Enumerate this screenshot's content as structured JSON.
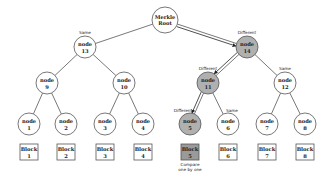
{
  "colors": {
    "same": "#ffffff",
    "different": "#b0b0b0",
    "block_different": "#9a9a9a",
    "stroke": "#555555"
  },
  "root": {
    "line1": "Merkle",
    "line2": "Root",
    "x": 165,
    "y": 20
  },
  "nodes": [
    {
      "id": "13",
      "label": "node",
      "num": "13",
      "x": 85,
      "y": 47,
      "status": "Same",
      "diff": false
    },
    {
      "id": "14",
      "label": "node",
      "num": "14",
      "x": 247,
      "y": 47,
      "status": "Different",
      "diff": true
    },
    {
      "id": "9",
      "label": "node",
      "num": "9",
      "x": 47,
      "y": 83,
      "status": "",
      "diff": false
    },
    {
      "id": "10",
      "label": "node",
      "num": "10",
      "x": 124,
      "y": 83,
      "status": "",
      "diff": false
    },
    {
      "id": "11",
      "label": "node",
      "num": "11",
      "x": 208,
      "y": 83,
      "status": "Different",
      "diff": true
    },
    {
      "id": "12",
      "label": "node",
      "num": "12",
      "x": 285,
      "y": 83,
      "status": "Same",
      "diff": false
    },
    {
      "id": "1",
      "label": "node",
      "num": "1",
      "x": 29,
      "y": 124,
      "status": "",
      "diff": false
    },
    {
      "id": "2",
      "label": "node",
      "num": "2",
      "x": 66,
      "y": 124,
      "status": "",
      "diff": false
    },
    {
      "id": "3",
      "label": "node",
      "num": "3",
      "x": 105,
      "y": 124,
      "status": "",
      "diff": false
    },
    {
      "id": "4",
      "label": "node",
      "num": "4",
      "x": 143,
      "y": 124,
      "status": "",
      "diff": false
    },
    {
      "id": "5",
      "label": "node",
      "num": "5",
      "x": 190,
      "y": 124,
      "status": "Different",
      "diff": true
    },
    {
      "id": "6",
      "label": "node",
      "num": "6",
      "x": 228,
      "y": 124,
      "status": "Same",
      "diff": false
    },
    {
      "id": "7",
      "label": "node",
      "num": "7",
      "x": 267,
      "y": 124,
      "status": "",
      "diff": false
    },
    {
      "id": "8",
      "label": "node",
      "num": "8",
      "x": 305,
      "y": 124,
      "status": "",
      "diff": false
    }
  ],
  "edges": [
    [
      "root",
      "13"
    ],
    [
      "root",
      "14"
    ],
    [
      "13",
      "9"
    ],
    [
      "13",
      "10"
    ],
    [
      "14",
      "11"
    ],
    [
      "14",
      "12"
    ],
    [
      "9",
      "1"
    ],
    [
      "9",
      "2"
    ],
    [
      "10",
      "3"
    ],
    [
      "10",
      "4"
    ],
    [
      "11",
      "5"
    ],
    [
      "11",
      "6"
    ],
    [
      "12",
      "7"
    ],
    [
      "12",
      "8"
    ]
  ],
  "diff_path": [
    [
      "root",
      "14"
    ],
    [
      "14",
      "11"
    ],
    [
      "11",
      "5"
    ]
  ],
  "blocks": [
    {
      "label": "Block",
      "num": "1",
      "x": 29,
      "diff": false
    },
    {
      "label": "Block",
      "num": "2",
      "x": 66,
      "diff": false
    },
    {
      "label": "Block",
      "num": "3",
      "x": 105,
      "diff": false
    },
    {
      "label": "Block",
      "num": "4",
      "x": 143,
      "diff": false
    },
    {
      "label": "Block",
      "num": "5",
      "x": 190,
      "diff": true
    },
    {
      "label": "Block",
      "num": "6",
      "x": 228,
      "diff": false
    },
    {
      "label": "Block",
      "num": "7",
      "x": 267,
      "diff": false
    },
    {
      "label": "Block",
      "num": "8",
      "x": 305,
      "diff": false
    }
  ],
  "compare_note": {
    "line1": "Compare",
    "line2": "one by one"
  }
}
